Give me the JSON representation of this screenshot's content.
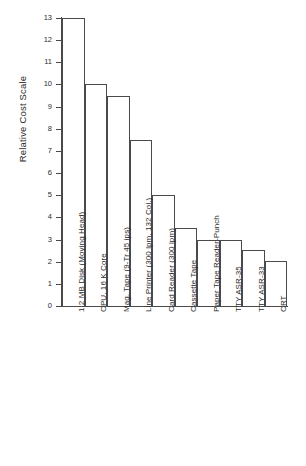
{
  "chart_data": {
    "type": "bar",
    "title": "",
    "subtitle": "",
    "xlabel": "",
    "ylabel": "Relative Cost Scale",
    "ylim": [
      0,
      13
    ],
    "ytick_values": [
      0,
      1,
      2,
      3,
      4,
      5,
      6,
      7,
      8,
      9,
      10,
      11,
      12,
      13
    ],
    "ytick_labels": [
      "0",
      "1",
      "2",
      "3",
      "4",
      "5",
      "6",
      "7",
      "8",
      "9",
      "10",
      "11",
      "12",
      "13"
    ],
    "grid": false,
    "legend": false,
    "legend_position": "none",
    "bar_style": "outline",
    "bar_gap": 0,
    "categories": [
      "1.2 MB Disk (Moving Head)",
      "CPU, 16 K Core",
      "Mag. Tape (9-Tr 45 ips)",
      "Line Printer (300 lpm, 132 Col.)",
      "Card Reader (300 lpm)",
      "Cassette Tape",
      "Paper Tape Reader-Punch",
      "TTY ASR-35",
      "TTY ASR-33",
      "CRT"
    ],
    "values": [
      13.0,
      10.0,
      9.5,
      7.5,
      5.0,
      3.5,
      3.0,
      3.0,
      2.55,
      2.05
    ]
  },
  "colors": {
    "background": "#ffffff",
    "axis": "#4a4a4a",
    "bar_edge": "#4a4a4a",
    "bar_fill": "transparent",
    "text": "#2b2b2b"
  }
}
